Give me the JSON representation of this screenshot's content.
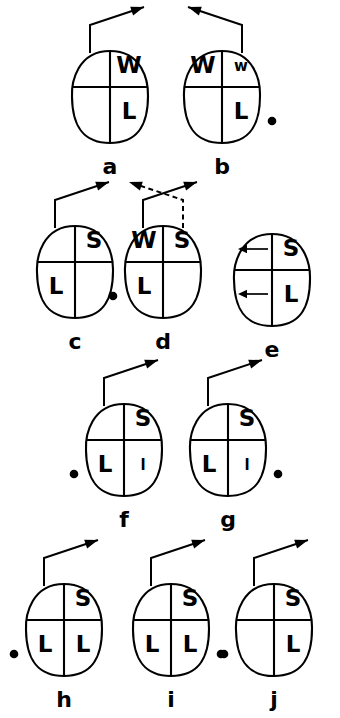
{
  "figure": {
    "background_color": "#ffffff",
    "ink_color": "#000000",
    "width": 340,
    "height": 718,
    "panel_count": 10
  },
  "chart_data": {
    "type": "diagram",
    "title": "",
    "panels": [
      {
        "caption": "a",
        "quadrants": {
          "upper_left": "",
          "upper_right": "W",
          "lower_left": "",
          "lower_right": "L"
        },
        "quadrant_sizes": {
          "upper_left": "",
          "upper_right": "big",
          "lower_left": "",
          "lower_right": "big"
        },
        "pointer": "elbow-up-left",
        "pointer_style": "solid",
        "second_pointer": "",
        "dot": "none",
        "inner_arrows": []
      },
      {
        "caption": "b",
        "quadrants": {
          "upper_left": "W",
          "upper_right": "w",
          "lower_left": "",
          "lower_right": "L"
        },
        "quadrant_sizes": {
          "upper_left": "big",
          "upper_right": "small",
          "lower_left": "",
          "lower_right": "big"
        },
        "pointer": "elbow-up-right",
        "pointer_style": "solid",
        "second_pointer": "",
        "dot": "right",
        "inner_arrows": []
      },
      {
        "caption": "c",
        "quadrants": {
          "upper_left": "",
          "upper_right": "S",
          "lower_left": "L",
          "lower_right": ""
        },
        "quadrant_sizes": {
          "upper_left": "",
          "upper_right": "big",
          "lower_left": "big",
          "lower_right": ""
        },
        "pointer": "elbow-up-left",
        "pointer_style": "solid",
        "second_pointer": "",
        "dot": "none",
        "inner_arrows": []
      },
      {
        "caption": "d",
        "quadrants": {
          "upper_left": "W",
          "upper_right": "S",
          "lower_left": "L",
          "lower_right": ""
        },
        "quadrant_sizes": {
          "upper_left": "big",
          "upper_right": "big",
          "lower_left": "big",
          "lower_right": ""
        },
        "pointer": "elbow-up-left",
        "pointer_style": "solid",
        "second_pointer": "elbow-up-right-dashed",
        "dot": "left",
        "inner_arrows": []
      },
      {
        "caption": "e",
        "quadrants": {
          "upper_left": "",
          "upper_right": "S",
          "lower_left": "",
          "lower_right": "L"
        },
        "quadrant_sizes": {
          "upper_left": "",
          "upper_right": "big",
          "lower_left": "",
          "lower_right": "big"
        },
        "pointer": "none",
        "pointer_style": "",
        "second_pointer": "",
        "dot": "none",
        "inner_arrows": [
          "upper-left-pointing-left",
          "lower-left-pointing-left"
        ]
      },
      {
        "caption": "f",
        "quadrants": {
          "upper_left": "",
          "upper_right": "S",
          "lower_left": "L",
          "lower_right": "l"
        },
        "quadrant_sizes": {
          "upper_left": "",
          "upper_right": "big",
          "lower_left": "big",
          "lower_right": "small"
        },
        "pointer": "elbow-up-left",
        "pointer_style": "solid",
        "second_pointer": "",
        "dot": "left",
        "inner_arrows": []
      },
      {
        "caption": "g",
        "quadrants": {
          "upper_left": "",
          "upper_right": "S",
          "lower_left": "L",
          "lower_right": "l"
        },
        "quadrant_sizes": {
          "upper_left": "",
          "upper_right": "big",
          "lower_left": "big",
          "lower_right": "small"
        },
        "pointer": "elbow-up-left",
        "pointer_style": "solid",
        "second_pointer": "",
        "dot": "right",
        "inner_arrows": []
      },
      {
        "caption": "h",
        "quadrants": {
          "upper_left": "",
          "upper_right": "S",
          "lower_left": "L",
          "lower_right": "L"
        },
        "quadrant_sizes": {
          "upper_left": "",
          "upper_right": "big",
          "lower_left": "big",
          "lower_right": "big"
        },
        "pointer": "elbow-up-left",
        "pointer_style": "solid",
        "second_pointer": "",
        "dot": "left",
        "inner_arrows": []
      },
      {
        "caption": "i",
        "quadrants": {
          "upper_left": "",
          "upper_right": "S",
          "lower_left": "L",
          "lower_right": "L"
        },
        "quadrant_sizes": {
          "upper_left": "",
          "upper_right": "big",
          "lower_left": "big",
          "lower_right": "big"
        },
        "pointer": "elbow-up-left",
        "pointer_style": "solid",
        "second_pointer": "",
        "dot": "right",
        "inner_arrows": []
      },
      {
        "caption": "j",
        "quadrants": {
          "upper_left": "",
          "upper_right": "S",
          "lower_left": "",
          "lower_right": "L"
        },
        "quadrant_sizes": {
          "upper_left": "",
          "upper_right": "big",
          "lower_left": "",
          "lower_right": "big"
        },
        "pointer": "elbow-up-left",
        "pointer_style": "solid",
        "second_pointer": "",
        "dot": "left",
        "inner_arrows": []
      }
    ]
  },
  "layout": {
    "rows": [
      {
        "panels": [
          "a",
          "b"
        ],
        "centers_x": [
          110,
          222
        ],
        "center_y": 95
      },
      {
        "panels": [
          "c",
          "d"
        ],
        "centers_x": [
          75,
          163
        ],
        "center_y": 270
      },
      {
        "panels": [
          "e"
        ],
        "centers_x": [
          272
        ],
        "center_y": 278
      },
      {
        "panels": [
          "f",
          "g"
        ],
        "centers_x": [
          124,
          228
        ],
        "center_y": 448
      },
      {
        "panels": [
          "h",
          "i",
          "j"
        ],
        "centers_x": [
          64,
          171,
          274
        ],
        "center_y": 628
      }
    ]
  },
  "captions": {
    "a": "a",
    "b": "b",
    "c": "c",
    "d": "d",
    "e": "e",
    "f": "f",
    "g": "g",
    "h": "h",
    "i": "i",
    "j": "j"
  }
}
